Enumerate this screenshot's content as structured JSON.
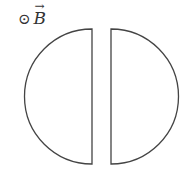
{
  "diagram": {
    "field_symbol": "⊙",
    "field_label": "B",
    "field_arrow": "→",
    "stroke_color": "#444444"
  }
}
